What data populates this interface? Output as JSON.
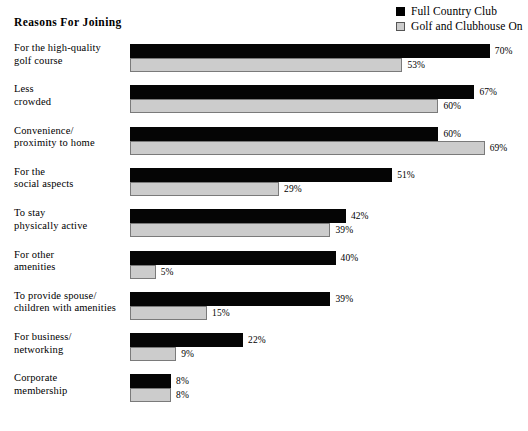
{
  "chart_data": {
    "type": "bar",
    "orientation": "horizontal",
    "title": "Reasons For Joining",
    "xlabel": "",
    "ylabel": "",
    "grid": false,
    "legend_position": "top-right",
    "value_suffix": "%",
    "xlim": [
      0,
      70
    ],
    "categories": [
      "For the high-quality golf course",
      "Less crowded",
      "Convenience/ proximity to home",
      "For the social aspects",
      "To stay physically active",
      "For other amenities",
      "To provide spouse/ children with amenities",
      "For business/ networking",
      "Corporate membership"
    ],
    "category_lines": [
      [
        "For the high-quality",
        "golf course"
      ],
      [
        "Less",
        "crowded"
      ],
      [
        "Convenience/",
        "proximity to home"
      ],
      [
        "For the",
        "social aspects"
      ],
      [
        "To stay",
        "physically active"
      ],
      [
        "For other",
        "amenities"
      ],
      [
        "To provide spouse/",
        "children with amenities"
      ],
      [
        "For business/",
        "networking"
      ],
      [
        "Corporate",
        "membership"
      ]
    ],
    "series": [
      {
        "name": "Full Country Club",
        "color": "#050505",
        "values": [
          70,
          67,
          60,
          51,
          42,
          40,
          39,
          22,
          8
        ],
        "labels": [
          "70%",
          "67%",
          "60%",
          "51%",
          "42%",
          "40%",
          "39%",
          "22%",
          "8%"
        ]
      },
      {
        "name": "Golf and Clubhouse On",
        "color": "#cccccc",
        "values": [
          53,
          60,
          69,
          29,
          39,
          5,
          15,
          9,
          8
        ],
        "labels": [
          "53%",
          "60%",
          "69%",
          "29%",
          "39%",
          "5%",
          "15%",
          "9%",
          "8%"
        ]
      }
    ]
  },
  "legend": {
    "items": [
      {
        "label": "Full Country Club",
        "swatch": "dark"
      },
      {
        "label": "Golf and Clubhouse On",
        "swatch": "light"
      }
    ]
  },
  "colors": {
    "series_dark": "#050505",
    "series_light": "#cccccc",
    "series_light_border": "#7a7a7a",
    "background": "#ffffff",
    "text": "#000000"
  }
}
